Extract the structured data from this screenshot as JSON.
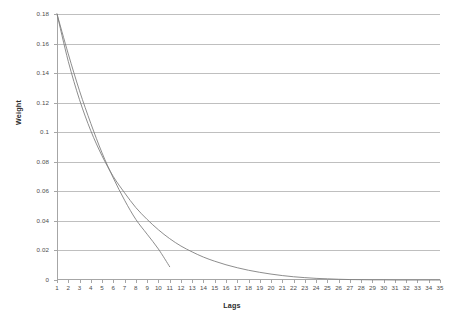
{
  "chart_data": {
    "type": "line",
    "title": "Soybean",
    "xlabel": "Lags",
    "ylabel": "Weight",
    "xlim": [
      1,
      35
    ],
    "ylim": [
      0,
      0.18
    ],
    "ytick_step": 0.02,
    "grid": "horizontal",
    "legend_position": "top-center",
    "xticks": [
      "1",
      "2",
      "3",
      "4",
      "5",
      "6",
      "7",
      "8",
      "9",
      "10",
      "11",
      "12",
      "13",
      "14",
      "15",
      "16",
      "17",
      "18",
      "19",
      "20",
      "21",
      "22",
      "23",
      "24",
      "25",
      "26",
      "27",
      "28",
      "29",
      "30",
      "31",
      "32",
      "33",
      "34",
      "35"
    ],
    "yticks": [
      "0",
      "0.02",
      "0.04",
      "0.06",
      "0.08",
      "0.1",
      "0.12",
      "0.14",
      "0.16",
      "0.18"
    ],
    "x": [
      1,
      2,
      3,
      4,
      5,
      6,
      7,
      8,
      9,
      10,
      11,
      12,
      13,
      14,
      15,
      16,
      17,
      18,
      19,
      20,
      21,
      22,
      23,
      24,
      25,
      26,
      27,
      28,
      29,
      30,
      31,
      32,
      33,
      34,
      35
    ],
    "series": [
      {
        "name": "k=12",
        "color": "#808080",
        "values": [
          0.18,
          0.153,
          0.128,
          0.106,
          0.086,
          0.069,
          0.054,
          0.041,
          0.031,
          0.021,
          0.009,
          null,
          null,
          null,
          null,
          null,
          null,
          null,
          null,
          null,
          null,
          null,
          null,
          null,
          null,
          null,
          null,
          null,
          null,
          null,
          null,
          null,
          null,
          null,
          null
        ]
      },
      {
        "name": "k=24",
        "color": "#ffffff",
        "values": [
          null,
          null,
          null,
          null,
          null,
          null,
          null,
          null,
          null,
          null,
          null,
          null,
          null,
          null,
          null,
          null,
          null,
          null,
          null,
          null,
          null,
          null,
          null,
          null,
          null,
          null,
          null,
          null,
          null,
          null,
          null,
          null,
          null,
          null,
          null
        ]
      },
      {
        "name": "k=36",
        "color": "#808080",
        "values": [
          0.18,
          0.148,
          0.122,
          0.101,
          0.084,
          0.07,
          0.059,
          0.049,
          0.041,
          0.034,
          0.028,
          0.023,
          0.019,
          0.0155,
          0.0127,
          0.0103,
          0.0083,
          0.0066,
          0.0052,
          0.004,
          0.003,
          0.0022,
          0.0016,
          0.0011,
          0.0008,
          0.0005,
          0.0003,
          0.0002,
          0.0001,
          0.0001,
          0.0,
          0.0,
          0.0,
          0.0,
          0.0
        ]
      }
    ]
  },
  "legend": [
    {
      "label": "k=12",
      "color": "#808080",
      "marker_visible": true
    },
    {
      "label": "k=24",
      "color": "#ffffff",
      "marker_visible": false
    },
    {
      "label": "k=36",
      "color": "#808080",
      "marker_visible": true
    }
  ],
  "colors": {
    "grid": "#bfbfbf",
    "axis": "#a6a6a6",
    "text": "#4d4d4d",
    "title": "#2b2b2b",
    "background": "#ffffff"
  }
}
